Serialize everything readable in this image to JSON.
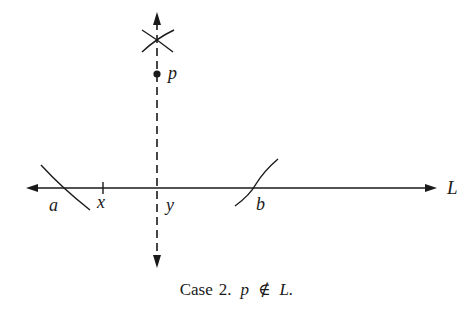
{
  "figure": {
    "labels": {
      "p": "p",
      "a": "a",
      "x": "x",
      "y": "y",
      "b": "b",
      "L": "L"
    },
    "caption": {
      "case_word": "Case",
      "case_number": "2.",
      "point": "p",
      "relation": "∉",
      "line": "L."
    },
    "colors": {
      "ink": "#1a1a1a",
      "background": "#ffffff"
    }
  }
}
